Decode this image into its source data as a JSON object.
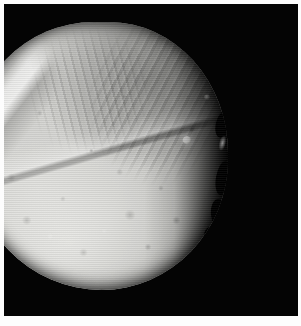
{
  "image": {
    "kind": "photograph",
    "subject": "miranda-moon",
    "caption": "",
    "palette": "grayscale",
    "colors": {
      "paper_border": "#fdfdfd",
      "sky_background": "#040404",
      "terrain_highlight": "#e8e8e5",
      "terrain_midtone": "#bdbdba",
      "terrain_shadow": "#6d6d6b",
      "terminator_shadow": "#050505"
    },
    "frame": {
      "width_px": 301,
      "height_px": 326,
      "border_width_px": 4,
      "plate_width_px": 294,
      "plate_height_px": 312
    },
    "disc": {
      "center_x_px": 99,
      "center_y_px": 156,
      "width_px": 258,
      "height_px": 268,
      "illuminated_fraction": "0.88",
      "terminator_side": "right"
    },
    "features": [
      {
        "name": "banded-corona-upper-right",
        "type": "corona",
        "brightness": "dark-banded"
      },
      {
        "name": "banded-corona-upper-centre",
        "type": "corona",
        "brightness": "mid-banded"
      },
      {
        "name": "bright-fault-scarp-left-limb",
        "type": "scarp",
        "brightness": "bright"
      },
      {
        "name": "major-diagonal-scarp",
        "type": "scarp",
        "brightness": "contrast-edge"
      },
      {
        "name": "cratered-southern-plains",
        "type": "plains",
        "brightness": "bright"
      },
      {
        "name": "bright-ray-crater",
        "type": "crater",
        "brightness": "very-bright"
      },
      {
        "name": "secondary-bright-crater",
        "type": "crater",
        "brightness": "bright"
      },
      {
        "name": "terminator-shadow-notches",
        "type": "shadow",
        "brightness": "black"
      }
    ]
  }
}
